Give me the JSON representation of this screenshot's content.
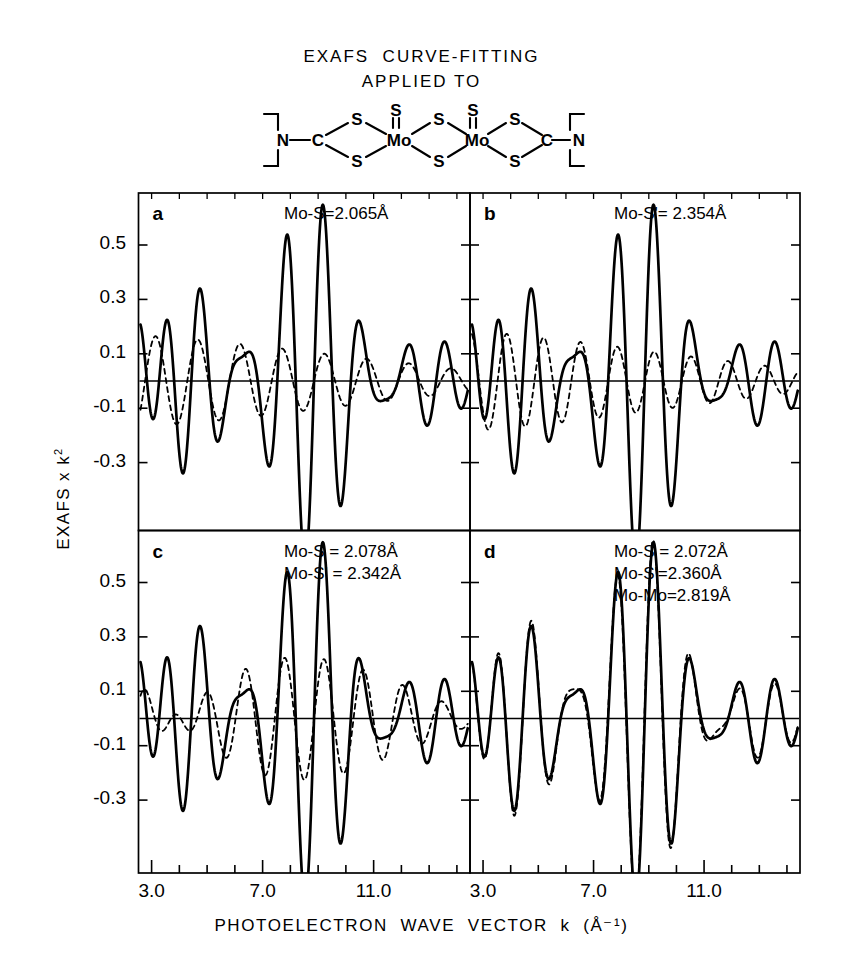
{
  "title": {
    "line1": "EXAFS  CURVE-FITTING",
    "line2": "APPLIED TO"
  },
  "molecule": {
    "name": "mo-dithiocarbamate-dimer",
    "atoms": [
      "N",
      "C",
      "S",
      "S",
      "Mo",
      "S",
      "S",
      "S",
      "Mo",
      "S",
      "S",
      "S",
      "C",
      "N"
    ],
    "labels": {
      "n": "N",
      "c": "C",
      "s": "S",
      "mo": "Mo"
    }
  },
  "axes": {
    "x_label": "PHOTOELECTRON  WAVE  VECTOR  k  (Å⁻¹)",
    "x_label_plain": "PHOTOELECTRON WAVE VECTOR k (A-1)",
    "y_label": "EXAFS x k",
    "y_label_exp": "2",
    "x_ticks_major": [
      "3.0",
      "7.0",
      "11.0"
    ],
    "x_tick_values": [
      3.0,
      7.0,
      11.0
    ],
    "x_minor_step": 1.0,
    "xlim": [
      2.6,
      14.4
    ],
    "y_ticks": [
      "0.5",
      "0.3",
      "0.1",
      "-0.1",
      "-0.3"
    ],
    "y_tick_values": [
      0.5,
      0.3,
      0.1,
      -0.1,
      -0.3
    ],
    "ylim": [
      -0.62,
      0.72
    ]
  },
  "panels": [
    {
      "id": "a",
      "letter": "a",
      "annotations": [
        "Mo-S=2.065Å"
      ],
      "fit_label": "single Mo-S shell"
    },
    {
      "id": "b",
      "letter": "b",
      "annotations": [
        "Mo-S'= 2.354Å"
      ],
      "fit_label": "single Mo-S' shell"
    },
    {
      "id": "c",
      "letter": "c",
      "annotations": [
        "Mo-S = 2.078Å",
        "Mo-S' = 2.342Å"
      ],
      "fit_label": "two sulfur shells"
    },
    {
      "id": "d",
      "letter": "d",
      "annotations": [
        "Mo-S = 2.072Å",
        "Mo-S'=2.360Å",
        "Mo-Mo=2.819Å"
      ],
      "fit_label": "two sulfur shells plus Mo-Mo"
    }
  ],
  "chart_data": {
    "type": "line",
    "xlabel": "PHOTOELECTRON WAVE VECTOR k (Å⁻¹)",
    "ylabel": "EXAFS x k²",
    "xlim": [
      2.6,
      14.4
    ],
    "ylim": [
      -0.62,
      0.72
    ],
    "grid": false,
    "legend": "none",
    "n_subplots": 4,
    "subplot_layout": "2x2",
    "shared_series": {
      "name": "experimental EXAFS data",
      "style": "solid",
      "color": "#000000",
      "description": "Same measured k^2-weighted EXAFS spectrum plotted in all four panels",
      "model": "sum of damped sinusoids",
      "components": [
        {
          "shell": "Mo-S",
          "R": 2.07,
          "amplitude": 0.3,
          "phase": 1.15,
          "damping": 0.028
        },
        {
          "shell": "Mo-S'",
          "R": 2.35,
          "amplitude": 0.26,
          "phase": 2.25,
          "damping": 0.03
        },
        {
          "shell": "Mo-Mo",
          "R": 2.82,
          "amplitude": 0.22,
          "phase": 0.35,
          "damping": 0.022
        }
      ],
      "peaks_k": [
        4.0,
        7.5,
        9.2,
        12.2
      ],
      "peaks_y": [
        0.38,
        0.42,
        0.6,
        0.31
      ],
      "troughs_k": [
        5.6,
        8.4,
        10.1,
        13.0
      ],
      "troughs_y": [
        -0.4,
        -0.45,
        -0.58,
        -0.42
      ]
    },
    "subplots": [
      {
        "panel": "a",
        "fit_series": {
          "name": "Mo-S = 2.065 Å fit",
          "style": "dashed",
          "color": "#000000",
          "components": [
            {
              "shell": "Mo-S",
              "R": 2.065,
              "amplitude": 0.22,
              "phase": 1.15,
              "damping": 0.03
            }
          ]
        },
        "annotations": [
          "Mo-S=2.065Å"
        ]
      },
      {
        "panel": "b",
        "fit_series": {
          "name": "Mo-S' = 2.354 Å fit",
          "style": "dashed",
          "color": "#000000",
          "components": [
            {
              "shell": "Mo-S'",
              "R": 2.354,
              "amplitude": 0.24,
              "phase": 2.25,
              "damping": 0.031
            }
          ]
        },
        "annotations": [
          "Mo-S'= 2.354Å"
        ]
      },
      {
        "panel": "c",
        "fit_series": {
          "name": "Mo-S = 2.078 Å + Mo-S' = 2.342 Å fit",
          "style": "dashed",
          "color": "#000000",
          "components": [
            {
              "shell": "Mo-S",
              "R": 2.078,
              "amplitude": 0.21,
              "phase": 1.15,
              "damping": 0.029
            },
            {
              "shell": "Mo-S'",
              "R": 2.342,
              "amplitude": 0.23,
              "phase": 2.25,
              "damping": 0.031
            }
          ]
        },
        "annotations": [
          "Mo-S = 2.078Å",
          "Mo-S' = 2.342Å"
        ]
      },
      {
        "panel": "d",
        "fit_series": {
          "name": "Mo-S = 2.072 Å + Mo-S' = 2.360 Å + Mo-Mo = 2.819 Å fit",
          "style": "dashed",
          "color": "#000000",
          "components": [
            {
              "shell": "Mo-S",
              "R": 2.072,
              "amplitude": 0.3,
              "phase": 1.15,
              "damping": 0.028
            },
            {
              "shell": "Mo-S'",
              "R": 2.36,
              "amplitude": 0.26,
              "phase": 2.25,
              "damping": 0.03
            },
            {
              "shell": "Mo-Mo",
              "R": 2.819,
              "amplitude": 0.22,
              "phase": 0.35,
              "damping": 0.022
            }
          ],
          "quality": "near-perfect overlay with data"
        },
        "annotations": [
          "Mo-S = 2.072Å",
          "Mo-S'=2.360Å",
          "Mo-Mo=2.819Å"
        ]
      }
    ]
  }
}
